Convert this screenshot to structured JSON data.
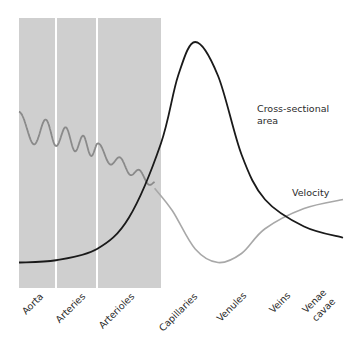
{
  "chart_data": {
    "type": "line",
    "title": "",
    "xlabel": "",
    "ylabel": "",
    "grid": false,
    "categories": [
      "Aorta",
      "Arteries",
      "Arterioles",
      "Capillaries",
      "Venules",
      "Veins",
      "Venae cavae"
    ],
    "shaded_segments": [
      "Aorta",
      "Arteries",
      "Arterioles"
    ],
    "colors": {
      "shade": "#cfcfcf",
      "cross_section": "#1a1a1a",
      "velocity": "#a8a8a8",
      "velocity_pulsatile": "#8a8a8a"
    },
    "series": [
      {
        "name": "Cross-sectional area",
        "label_lines": [
          "Cross-sectional",
          "area"
        ],
        "x": [
          0,
          1,
          2,
          2.5,
          3,
          3.3,
          3.6,
          4,
          4.5,
          5,
          5.5,
          6
        ],
        "values": [
          0.02,
          0.03,
          0.08,
          0.22,
          0.55,
          0.85,
          1.0,
          0.85,
          0.5,
          0.3,
          0.18,
          0.13
        ]
      },
      {
        "name": "Velocity",
        "label_lines": [
          "Velocity"
        ],
        "pulsatile_until": 2.9,
        "x": [
          0,
          1,
          2,
          2.9,
          3.2,
          3.6,
          4,
          4.5,
          5,
          5.5,
          6
        ],
        "values": [
          0.6,
          0.57,
          0.5,
          0.35,
          0.25,
          0.08,
          0.02,
          0.06,
          0.17,
          0.26,
          0.3
        ]
      }
    ]
  }
}
